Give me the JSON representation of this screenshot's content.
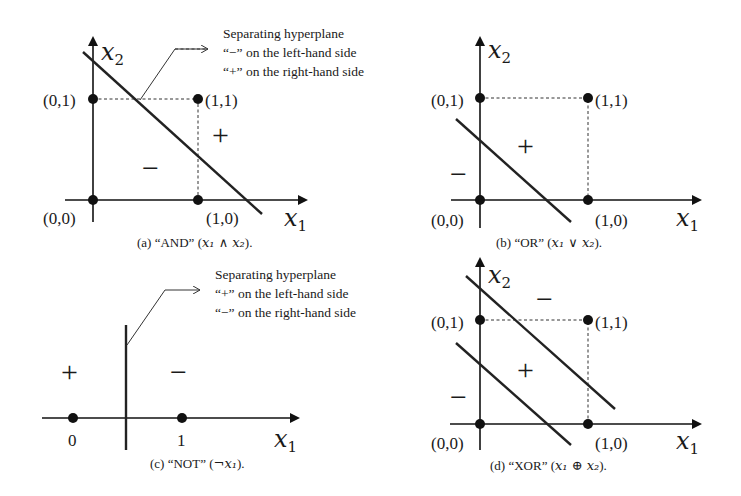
{
  "figure": {
    "panels": [
      {
        "id": "a",
        "caption_prefix": "(a) “AND” (",
        "caption_math": "x₁ ∧ x₂",
        "caption_suffix": ").",
        "axis_x_label": "x",
        "axis_x_sub": "1",
        "axis_y_label": "x",
        "axis_y_sub": "2",
        "point_labels": [
          "(0,0)",
          "(0,1)",
          "(1,0)",
          "(1,1)"
        ],
        "region_plus": "+",
        "region_minus": "−",
        "annotation": {
          "line1": "Separating hyperplane",
          "line2": "“−” on the left-hand side",
          "line3": "“+” on the right-hand side"
        }
      },
      {
        "id": "b",
        "caption_prefix": "(b) “OR” (",
        "caption_math": "x₁ ∨ x₂",
        "caption_suffix": ").",
        "axis_x_label": "x",
        "axis_x_sub": "1",
        "axis_y_label": "x",
        "axis_y_sub": "2",
        "point_labels": [
          "(0,0)",
          "(0,1)",
          "(1,0)",
          "(1,1)"
        ],
        "region_plus": "+",
        "region_minus": "−"
      },
      {
        "id": "c",
        "caption_prefix": "(c) “NOT” (",
        "caption_math": "¬x₁",
        "caption_suffix": ").",
        "axis_x_label": "x",
        "axis_x_sub": "1",
        "point_labels": [
          "0",
          "1"
        ],
        "region_plus": "+",
        "region_minus": "−",
        "annotation": {
          "line1": "Separating hyperplane",
          "line2": "“+” on the left-hand side",
          "line3": "“−” on the right-hand side"
        }
      },
      {
        "id": "d",
        "caption_prefix": "(d) “XOR” (",
        "caption_math": "x₁ ⊕ x₂",
        "caption_suffix": ").",
        "axis_x_label": "x",
        "axis_x_sub": "1",
        "axis_y_label": "x",
        "axis_y_sub": "2",
        "point_labels": [
          "(0,0)",
          "(0,1)",
          "(1,0)",
          "(1,1)"
        ],
        "region_plus": "+",
        "region_minus_top": "−",
        "region_minus_bottom": "−"
      }
    ]
  }
}
